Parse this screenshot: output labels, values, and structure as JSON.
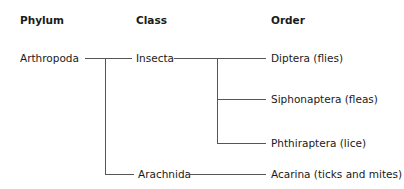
{
  "headers": {
    "phylum": "Phylum",
    "class": "Class",
    "order": "Order"
  },
  "tree": {
    "phylum": "Arthropoda",
    "classes": [
      {
        "name": "Insecta",
        "orders": [
          "Diptera (flies)",
          "Siphonaptera (fleas)",
          "Phthiraptera (lice)"
        ]
      },
      {
        "name": "Arachnida",
        "orders": [
          "Acarina (ticks and mites)"
        ]
      }
    ]
  }
}
